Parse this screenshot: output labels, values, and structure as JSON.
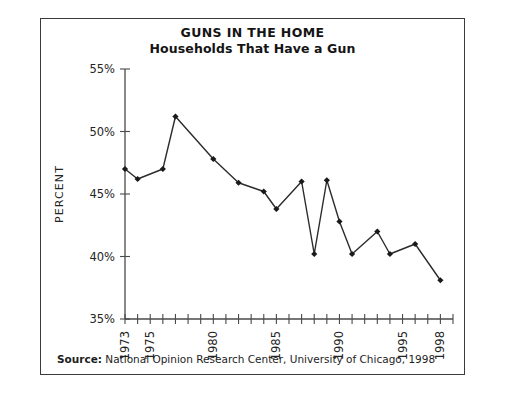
{
  "figure": {
    "title": "GUNS IN THE HOME",
    "subtitle": "Households That Have a Gun"
  },
  "source": {
    "label": "Source:",
    "text": " National Opinion Research Center, University of Chicago, 1998"
  },
  "chart_data": {
    "type": "line",
    "title": "GUNS IN THE HOME",
    "subtitle": "Households That Have a Gun",
    "xlabel": "",
    "ylabel": "PERCENT",
    "ylim": [
      35,
      55
    ],
    "xlim": [
      1973,
      1999
    ],
    "grid": false,
    "legend": null,
    "ytick_values": [
      35,
      40,
      45,
      50,
      55
    ],
    "ytick_labels": [
      "35%",
      "40%",
      "45%",
      "50%",
      "55%"
    ],
    "xtick_values": [
      1973,
      1974,
      1975,
      1976,
      1977,
      1978,
      1979,
      1980,
      1981,
      1982,
      1983,
      1984,
      1985,
      1986,
      1987,
      1988,
      1989,
      1990,
      1991,
      1992,
      1993,
      1994,
      1995,
      1996,
      1997,
      1998,
      1999
    ],
    "xtick_labeled": [
      {
        "value": 1973,
        "label": "1973"
      },
      {
        "value": 1975,
        "label": "1975"
      },
      {
        "value": 1980,
        "label": "1980"
      },
      {
        "value": 1985,
        "label": "1985"
      },
      {
        "value": 1990,
        "label": "1990"
      },
      {
        "value": 1995,
        "label": "1995"
      },
      {
        "value": 1998,
        "label": "1998"
      }
    ],
    "marker": "diamond",
    "series": [
      {
        "name": "Households That Have a Gun",
        "x": [
          1973,
          1974,
          1976,
          1977,
          1980,
          1982,
          1984,
          1985,
          1987,
          1988,
          1989,
          1990,
          1991,
          1993,
          1994,
          1996,
          1998
        ],
        "values": [
          47.0,
          46.2,
          47.0,
          51.2,
          47.8,
          45.9,
          45.2,
          43.8,
          46.0,
          40.2,
          46.1,
          42.8,
          40.2,
          42.0,
          40.2,
          41.0,
          38.1
        ]
      }
    ]
  }
}
